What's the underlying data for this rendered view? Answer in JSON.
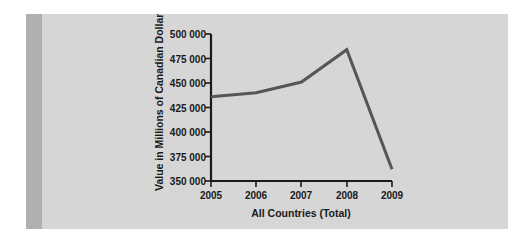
{
  "figure": {
    "background_color": "#ffffff",
    "panel_color": "#d6d6d6",
    "gutter_color": "#b0b0b0",
    "axis_color": "#1a1a1a",
    "series_color": "#55555a"
  },
  "chart_data": {
    "type": "line",
    "title": "",
    "subtitle": "",
    "xlabel": "All Countries (Total)",
    "ylabel": "Value in Millions of Canadian Dollars",
    "categories": [
      "2005",
      "2006",
      "2007",
      "2008",
      "2009"
    ],
    "x": [
      2005,
      2006,
      2007,
      2008,
      2009
    ],
    "values": [
      436000,
      440000,
      451000,
      484000,
      362000
    ],
    "series": [
      {
        "name": "All Countries (Total)",
        "values": [
          436000,
          440000,
          451000,
          484000,
          362000
        ],
        "color": "#55555a"
      }
    ],
    "ylim": [
      350000,
      500000
    ],
    "ytick_values": [
      350000,
      375000,
      400000,
      425000,
      450000,
      475000,
      500000
    ],
    "ytick_labels": [
      "350 000",
      "375 000",
      "400 000",
      "425 000",
      "450 000",
      "475 000",
      "500 000"
    ],
    "xtick_labels": [
      "2005",
      "2006",
      "2007",
      "2008",
      "2009"
    ],
    "grid": false,
    "legend": false,
    "legend_position": "none"
  }
}
